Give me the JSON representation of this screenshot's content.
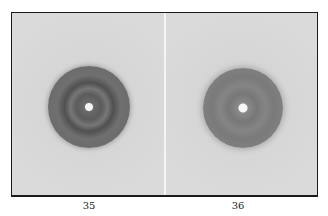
{
  "figure": {
    "panels": [
      {
        "label": "35",
        "description": "X-ray diffraction pattern with dark outer ring and four darker spots around central bright hole"
      },
      {
        "label": "36",
        "description": "X-ray diffraction pattern with diffuse lighter ring around central bright hole"
      }
    ]
  }
}
